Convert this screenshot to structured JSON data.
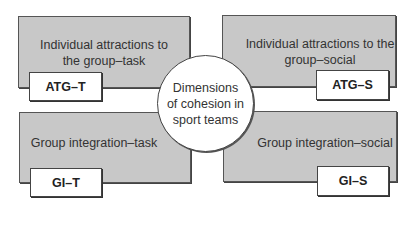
{
  "center": {
    "lines": [
      "Dimensions",
      "of cohesion in",
      "sport teams"
    ]
  },
  "quadrants": [
    {
      "position": "top-left",
      "lines": [
        "Individual attractions to",
        "the group–task"
      ],
      "abbr": "ATG–T"
    },
    {
      "position": "top-right",
      "lines": [
        "Individual attractions to the",
        "group–social"
      ],
      "abbr": "ATG–S"
    },
    {
      "position": "bottom-left",
      "lines": [
        "Group integration–task"
      ],
      "abbr": "GI–T"
    },
    {
      "position": "bottom-right",
      "lines": [
        "Group integration–social"
      ],
      "abbr": "GI–S"
    }
  ],
  "colors": {
    "box_fill": "#c8c8c8",
    "tag_fill": "#ffffff",
    "border": "#444444"
  }
}
